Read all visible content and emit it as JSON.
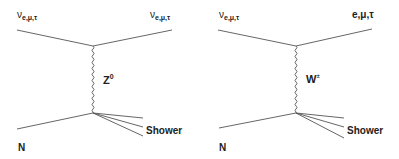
{
  "diagrams": [
    {
      "name": "neutral-current",
      "incoming_lepton": {
        "base": "ν",
        "sub": "e,μ,τ"
      },
      "outgoing_lepton": {
        "base": "ν",
        "sub": "e,μ,τ"
      },
      "boson": {
        "base": "Z",
        "sup": "0"
      },
      "nucleon": "N",
      "shower": "Shower"
    },
    {
      "name": "charged-current",
      "incoming_lepton": {
        "base": "ν",
        "sub": "e,μ,τ"
      },
      "outgoing_lepton": {
        "base": "e,μ,τ"
      },
      "boson": {
        "base": "W",
        "sup": "±"
      },
      "nucleon": "N",
      "shower": "Shower"
    }
  ],
  "colors": {
    "line": "#555555",
    "text": "#222222",
    "background": "#ffffff"
  }
}
